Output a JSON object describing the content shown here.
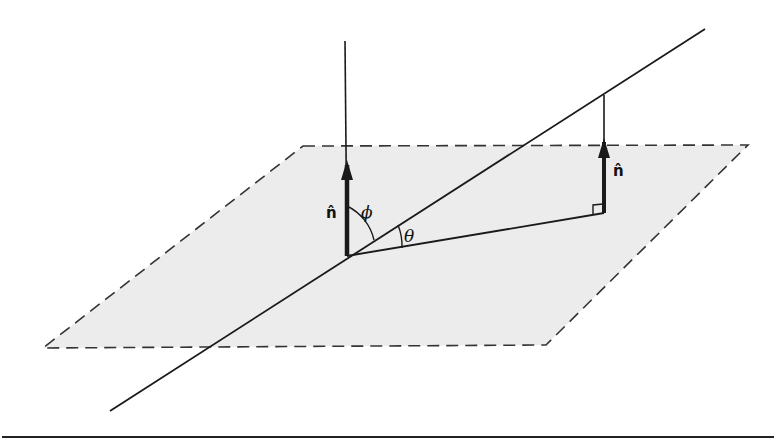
{
  "diagram": {
    "type": "geometry",
    "colors": {
      "plane_fill": "#ececec",
      "stroke": "#1a1a1a"
    },
    "labels": {
      "normal_left": "n̂",
      "normal_right": "n̂",
      "phi": "ϕ",
      "theta": "θ"
    },
    "geometry": {
      "plane_corners": [
        [
          303,
          146
        ],
        [
          748,
          145
        ],
        [
          546,
          345
        ],
        [
          43,
          348
        ]
      ],
      "origin": [
        347,
        256
      ],
      "oblique_line": [
        [
          705,
          29
        ],
        [
          110,
          411
        ]
      ],
      "vertical_line_left": [
        [
          345,
          41
        ],
        [
          347,
          256
        ]
      ],
      "vertical_line_right": [
        [
          604,
          95
        ],
        [
          604,
          213
        ]
      ],
      "projection_line": [
        [
          347,
          256
        ],
        [
          604,
          213
        ]
      ]
    }
  }
}
